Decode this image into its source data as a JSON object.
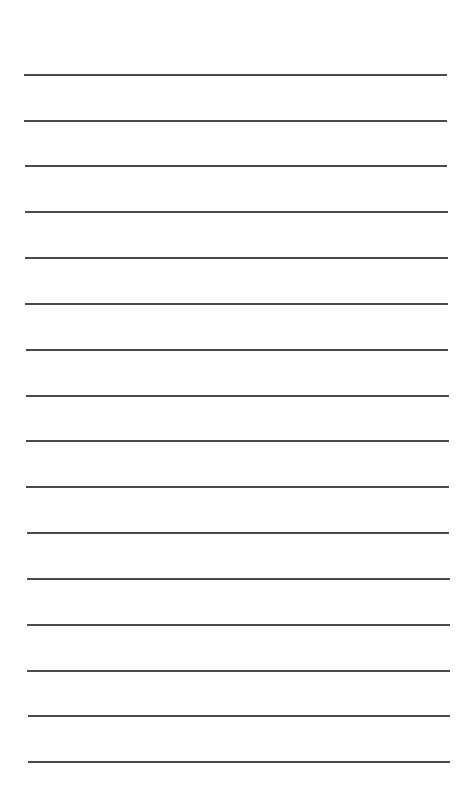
{
  "page": {
    "type": "lined-paper",
    "background_color": "#ffffff",
    "line_color": "#4a4a4a",
    "line_count": 16,
    "lines": [
      {
        "y": 75,
        "x1": 24,
        "x2": 447
      },
      {
        "y": 121,
        "x1": 24,
        "x2": 447
      },
      {
        "y": 166,
        "x1": 25,
        "x2": 447
      },
      {
        "y": 212,
        "x1": 25,
        "x2": 448
      },
      {
        "y": 258,
        "x1": 25,
        "x2": 448
      },
      {
        "y": 304,
        "x1": 25,
        "x2": 448
      },
      {
        "y": 350,
        "x1": 26,
        "x2": 448
      },
      {
        "y": 396,
        "x1": 26,
        "x2": 449
      },
      {
        "y": 441,
        "x1": 26,
        "x2": 449
      },
      {
        "y": 487,
        "x1": 26,
        "x2": 449
      },
      {
        "y": 533,
        "x1": 27,
        "x2": 449
      },
      {
        "y": 579,
        "x1": 27,
        "x2": 450
      },
      {
        "y": 625,
        "x1": 27,
        "x2": 450
      },
      {
        "y": 671,
        "x1": 27,
        "x2": 450
      },
      {
        "y": 716,
        "x1": 28,
        "x2": 450
      },
      {
        "y": 762,
        "x1": 28,
        "x2": 450
      }
    ]
  }
}
